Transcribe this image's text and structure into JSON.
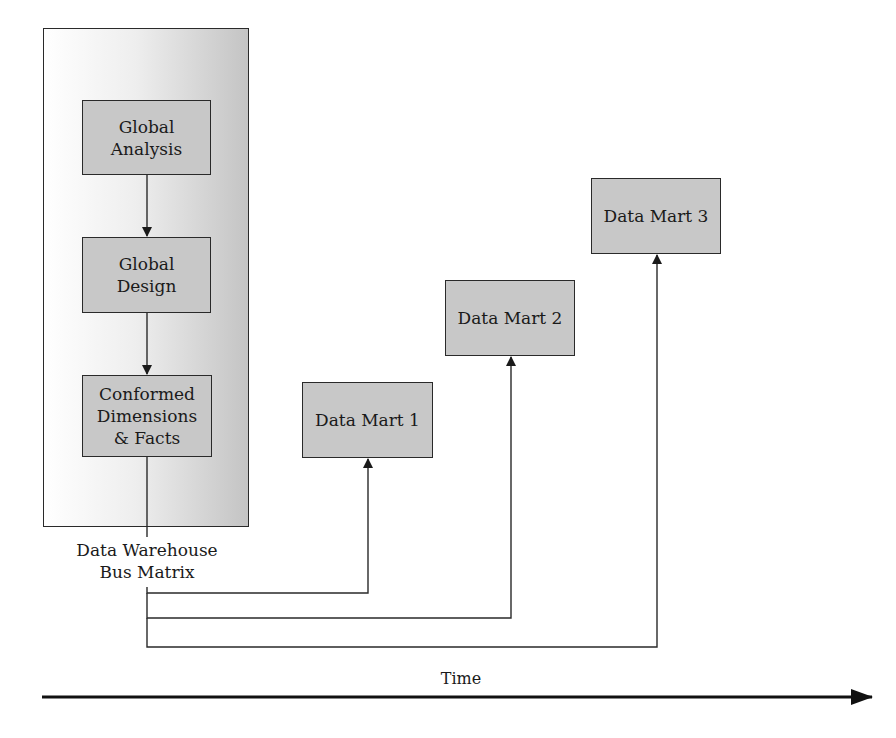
{
  "diagram": {
    "panel": {
      "boxes": [
        {
          "id": "global-analysis",
          "lines": [
            "Global",
            "Analysis"
          ]
        },
        {
          "id": "global-design",
          "lines": [
            "Global",
            "Design"
          ]
        },
        {
          "id": "conformed",
          "lines": [
            "Conformed",
            "Dimensions",
            "& Facts"
          ]
        }
      ],
      "caption": [
        "Data Warehouse",
        "Bus Matrix"
      ]
    },
    "data_marts": [
      {
        "label": "Data Mart 1"
      },
      {
        "label": "Data Mart 2"
      },
      {
        "label": "Data Mart 3"
      }
    ],
    "time_axis": {
      "label": "Time"
    },
    "colors": {
      "box_fill": "#c8c8c8",
      "line": "#2a2a2a",
      "panel_gradient_end": "#c4c4c4"
    }
  }
}
